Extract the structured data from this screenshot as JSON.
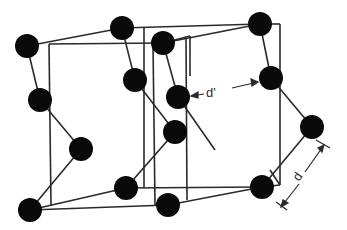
{
  "diagram": {
    "type": "crystal-lattice",
    "colors": {
      "atom": "#0a0a0a",
      "line": "#2a2a2a",
      "background": "#ffffff"
    },
    "atoms": [
      {
        "id": "a1",
        "x": 27,
        "y": 46
      },
      {
        "id": "a2",
        "x": 40,
        "y": 100
      },
      {
        "id": "a3",
        "x": 81,
        "y": 149
      },
      {
        "id": "a4",
        "x": 30,
        "y": 210
      },
      {
        "id": "b1",
        "x": 122,
        "y": 28
      },
      {
        "id": "b2",
        "x": 135,
        "y": 80
      },
      {
        "id": "b3",
        "x": 175,
        "y": 132
      },
      {
        "id": "b4",
        "x": 126,
        "y": 188
      },
      {
        "id": "c1",
        "x": 163,
        "y": 43
      },
      {
        "id": "c2",
        "x": 178,
        "y": 97
      },
      {
        "id": "c3",
        "x": 168,
        "y": 205
      },
      {
        "id": "d1",
        "x": 260,
        "y": 24
      },
      {
        "id": "d2",
        "x": 271,
        "y": 78
      },
      {
        "id": "d3",
        "x": 312,
        "y": 127
      },
      {
        "id": "d4",
        "x": 262,
        "y": 187
      }
    ],
    "atom_radius": 12,
    "labels": {
      "d_prime": "d'",
      "d": "d"
    }
  }
}
